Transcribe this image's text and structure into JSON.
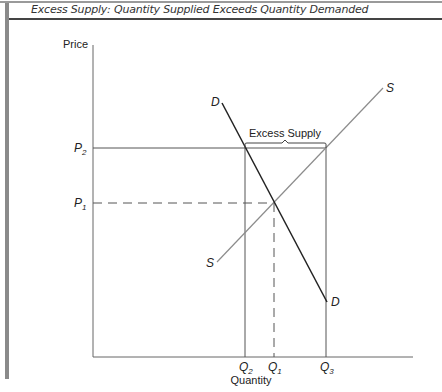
{
  "figure": {
    "caption": "Excess Supply: Quantity Supplied Exceeds Quantity Demanded",
    "y_axis_label": "Price",
    "x_axis_label": "Quantity",
    "price_labels": {
      "p2": "P",
      "p2_sub": "2",
      "p1": "P",
      "p1_sub": "1"
    },
    "quantity_labels": {
      "q2": "Q",
      "q2_sub": "2",
      "q1": "Q",
      "q1_sub": "1",
      "q3": "Q",
      "q3_sub": "3"
    },
    "curves": {
      "demand_label_top": "D",
      "demand_label_bottom": "D",
      "supply_label_top": "S",
      "supply_label_bottom": "S"
    },
    "annotation": "Excess Supply",
    "colors": {
      "demand": "#222222",
      "supply": "#8c8c8c",
      "axes": "#555555",
      "guides": "#555555"
    }
  }
}
